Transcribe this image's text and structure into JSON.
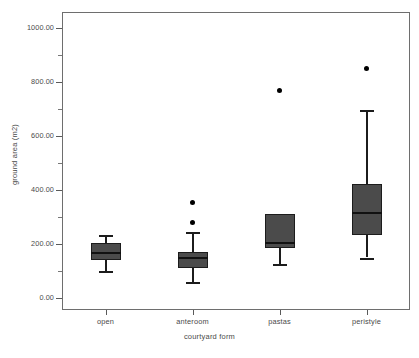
{
  "chart_data": {
    "type": "box",
    "title": "",
    "xlabel": "courtyard form",
    "ylabel": "ground area (m2)",
    "ylim": [
      0,
      1000
    ],
    "grid": false,
    "legend": "none",
    "categories": [
      "open",
      "anteroom",
      "pastas",
      "peristyle"
    ],
    "y_ticks": [
      {
        "value": 1000,
        "label": "1000.00"
      },
      {
        "value": 800,
        "label": "800.00"
      },
      {
        "value": 600,
        "label": "600.00"
      },
      {
        "value": 400,
        "label": "400.00"
      },
      {
        "value": 200,
        "label": "200.00"
      },
      {
        "value": 0,
        "label": "0.00"
      }
    ],
    "y_minor_ticks": [
      900,
      700,
      500,
      300,
      100
    ],
    "boxes": [
      {
        "category": "open",
        "whisker_low": 100,
        "q1": 140,
        "median": 165,
        "q3": 205,
        "whisker_high": 235,
        "outliers": []
      },
      {
        "category": "anteroom",
        "whisker_low": 60,
        "q1": 110,
        "median": 148,
        "q3": 172,
        "whisker_high": 245,
        "outliers": [
          280,
          355
        ]
      },
      {
        "category": "pastas",
        "whisker_low": 125,
        "q1": 185,
        "median": 205,
        "q3": 310,
        "whisker_high": 310,
        "outliers": [
          770
        ]
      },
      {
        "category": "peristyle",
        "whisker_low": 150,
        "q1": 232,
        "median": 315,
        "q3": 422,
        "whisker_high": 695,
        "outliers": [
          850
        ]
      }
    ],
    "colors": {
      "box_fill": "#4b4b4b",
      "box_edge": "#1c1c1c",
      "median": "#111111",
      "outlier": "#000000",
      "frame": "#6e6e6e",
      "text": "#4a4a4a",
      "background": "#ffffff"
    }
  }
}
